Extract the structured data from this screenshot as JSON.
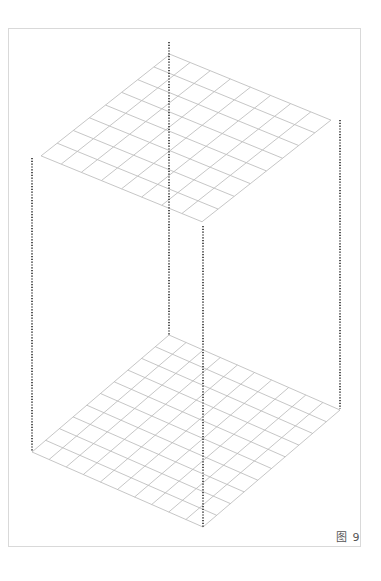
{
  "figure": {
    "caption": "图 9",
    "colors": {
      "grid_line": "#b8b8b8",
      "dotted_line": "#555555",
      "frame": "#d9d9d9",
      "background": "#ffffff"
    },
    "lower_grid": {
      "description": "flat square grid in oblique projection",
      "cells_per_side": 10,
      "corners": {
        "left": [
          32,
          452
        ],
        "top": [
          169,
          335
        ],
        "right": [
          340,
          409
        ],
        "bottom": [
          203,
          527
        ]
      }
    },
    "upper_grid": {
      "description": "rotated grid with staircase diamond boundary",
      "corners": {
        "left": [
          32,
          158
        ],
        "top": [
          169,
          48
        ],
        "right": [
          340,
          120
        ],
        "bottom": [
          203,
          226
        ]
      }
    },
    "vertical_dotted_lines": [
      {
        "x": 32,
        "y_top": 158,
        "y_bottom": 452
      },
      {
        "x": 169,
        "y_top": 42,
        "y_bottom": 335
      },
      {
        "x": 340,
        "y_top": 120,
        "y_bottom": 409
      },
      {
        "x": 203,
        "y_top": 226,
        "y_bottom": 527
      }
    ]
  }
}
